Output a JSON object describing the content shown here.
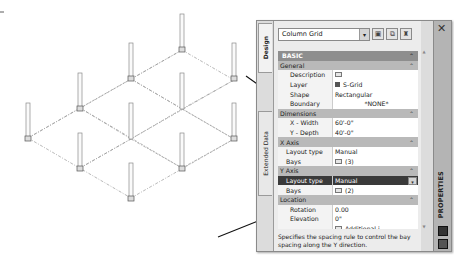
{
  "palette": {
    "title": "PROPERTIES",
    "close_icon": "✕",
    "tabs": [
      {
        "label": "Design",
        "active": true
      },
      {
        "label": "Extended Data",
        "active": false
      }
    ],
    "style_select": {
      "value": "Column Grid",
      "dropdown_icon": "▾"
    },
    "toolbar_buttons": [
      {
        "name": "select-objects-icon",
        "glyph": "▣"
      },
      {
        "name": "quick-select-icon",
        "glyph": "⧉"
      },
      {
        "name": "style-manager-icon",
        "glyph": "♜"
      }
    ],
    "grid": {
      "basic": {
        "label": "BASIC",
        "caret": "⌃"
      },
      "categories": {
        "general": {
          "label": "General",
          "caret": "⌃",
          "props": [
            {
              "label": "Description",
              "value": ""
            },
            {
              "label": "Layer",
              "value": "S-Grid"
            },
            {
              "label": "Shape",
              "value": "Rectangular"
            },
            {
              "label": "Boundary",
              "value": "*NONE*"
            }
          ]
        },
        "dimensions": {
          "label": "Dimensions",
          "caret": "⌃",
          "props": [
            {
              "label": "X - Width",
              "value": "60'-0\""
            },
            {
              "label": "Y - Depth",
              "value": "40'-0\""
            }
          ]
        },
        "x_axis": {
          "label": "X Axis",
          "caret": "⌃",
          "props": [
            {
              "label": "Layout type",
              "value": "Manual"
            },
            {
              "label": "Bays",
              "value": "(3)"
            }
          ]
        },
        "y_axis": {
          "label": "Y Axis",
          "caret": "⌃",
          "props": [
            {
              "label": "Layout type",
              "value": "Manual",
              "selected": true,
              "dropdown_icon": "▾"
            },
            {
              "label": "Bays",
              "value": "(2)"
            }
          ]
        },
        "location": {
          "label": "Location",
          "caret": "⌃",
          "props": [
            {
              "label": "Rotation",
              "value": "0.00"
            },
            {
              "label": "Elevation",
              "value": "0\""
            },
            {
              "label": "",
              "value": "Additional i..."
            }
          ]
        }
      }
    },
    "description_text": "Specifies the spacing rule to control the bay spacing along the Y direction.",
    "scroll": {
      "up": "▲",
      "down": "▼"
    }
  }
}
